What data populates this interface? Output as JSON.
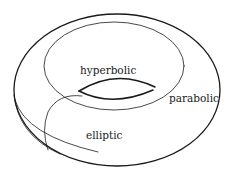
{
  "diagram": {
    "type": "torus",
    "stroke_color": "#1a1a1a",
    "background": "#ffffff",
    "labels": {
      "hyperbolic": "hyperbolic",
      "parabolic": "parabolic",
      "elliptic": "elliptic"
    }
  }
}
